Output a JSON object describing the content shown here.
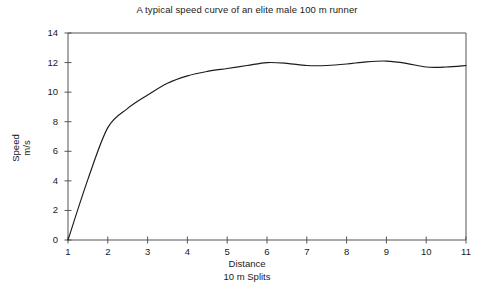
{
  "chart_data": {
    "type": "line",
    "title": "A typical speed curve of an elite male 100 m runner",
    "xlabel": "Distance",
    "xlabel_sub": "10 m Splits",
    "ylabel": "Speed",
    "ylabel_sub": "m/s",
    "xlim": [
      1,
      11
    ],
    "ylim": [
      0,
      14
    ],
    "xticks": [
      1,
      2,
      3,
      4,
      5,
      6,
      7,
      8,
      9,
      10,
      11
    ],
    "xtick_labels": [
      "1",
      "2",
      "3",
      "4",
      "5",
      "6",
      "7",
      "8",
      "9",
      "10",
      "11"
    ],
    "yticks": [
      0,
      2,
      4,
      6,
      8,
      10,
      12,
      14
    ],
    "ytick_labels": [
      "0",
      "2",
      "4",
      "6",
      "8",
      "10",
      "12",
      "14"
    ],
    "grid": false,
    "legend": false,
    "line_color": "#1a1a1a",
    "frame_color": "#555555",
    "x": [
      1,
      1.5,
      2,
      2.5,
      3,
      3.5,
      4,
      4.5,
      5,
      5.5,
      6,
      6.5,
      7,
      7.5,
      8,
      8.5,
      9,
      9.5,
      10,
      10.5,
      11
    ],
    "values": [
      0,
      4.1,
      7.6,
      8.9,
      9.8,
      10.6,
      11.1,
      11.4,
      11.6,
      11.8,
      12.0,
      11.95,
      11.8,
      11.8,
      11.9,
      12.05,
      12.1,
      11.95,
      11.7,
      11.7,
      11.8
    ]
  }
}
